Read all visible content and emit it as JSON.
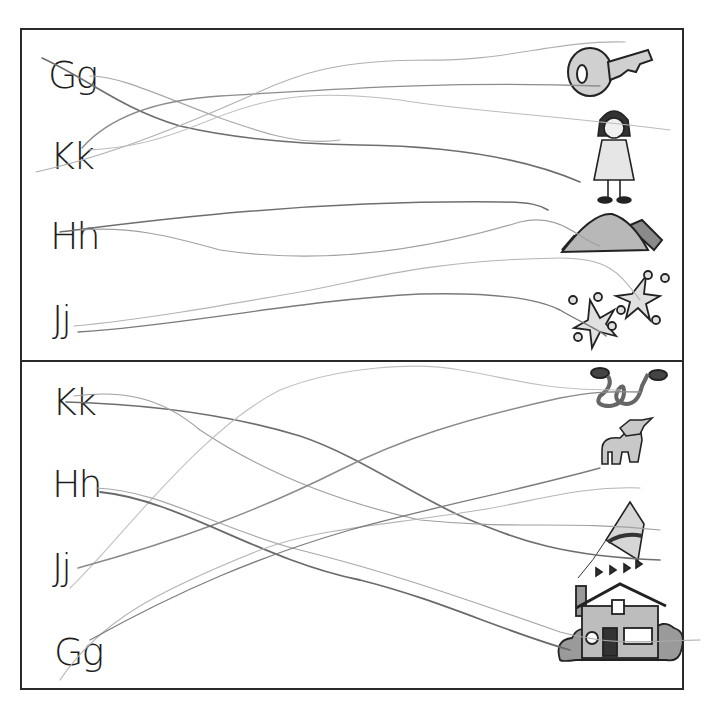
{
  "worksheet": {
    "top_section": {
      "letters": [
        "Gg",
        "Kk",
        "Hh",
        "Jj"
      ],
      "pictures": [
        "key",
        "girl",
        "hill",
        "jacks"
      ]
    },
    "bottom_section": {
      "letters": [
        "Kk",
        "Hh",
        "Jj",
        "Gg"
      ],
      "pictures": [
        "jump-rope",
        "goat",
        "kite",
        "house"
      ]
    }
  },
  "colors": {
    "frame": "#2a2a2a",
    "pencil_dark": "#6e6e6e",
    "pencil_light": "#b4b4b4",
    "picture_fill": "#c8c8c8"
  }
}
